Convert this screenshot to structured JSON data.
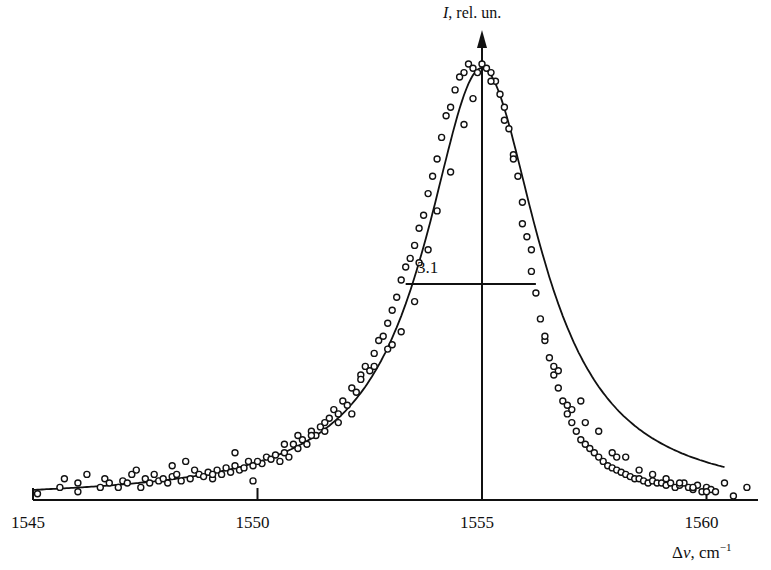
{
  "chart_data": {
    "type": "scatter",
    "title": "",
    "xlabel": "Δν, cm⁻¹",
    "xlabel_symbol": "Δν",
    "xlabel_unit": "cm",
    "xlabel_unit_exp": "−1",
    "ylabel": "I, rel. un.",
    "ylabel_symbol": "I",
    "ylabel_rest": ", rel. un.",
    "xlim": [
      1545,
      1561.2
    ],
    "ylim": [
      0,
      1.08
    ],
    "x_ticks": [
      1545,
      1550,
      1555,
      1560
    ],
    "x_tick_labels": [
      "1545",
      "1550",
      "1555",
      "1560"
    ],
    "grid": false,
    "legend": null,
    "annotations": [
      {
        "type": "fwhm_line",
        "label": "3.1",
        "x_from": 1553.3,
        "x_to": 1556.2,
        "y": 0.5
      }
    ],
    "series": [
      {
        "name": "fit",
        "kind": "line",
        "model": "lorentzian",
        "center": 1555.0,
        "fwhm": 3.1,
        "amplitude": 1.0
      },
      {
        "name": "measured",
        "kind": "scatter",
        "marker": "open-circle",
        "x": [
          1545.1,
          1545.6,
          1545.7,
          1546.0,
          1546.0,
          1546.2,
          1546.5,
          1546.6,
          1546.7,
          1546.9,
          1547.0,
          1547.1,
          1547.2,
          1547.4,
          1547.5,
          1547.6,
          1547.7,
          1547.8,
          1547.9,
          1548.0,
          1548.1,
          1548.2,
          1548.3,
          1548.5,
          1548.6,
          1548.7,
          1548.8,
          1548.9,
          1549.0,
          1549.1,
          1549.2,
          1549.3,
          1549.4,
          1549.5,
          1549.6,
          1549.7,
          1549.8,
          1549.9,
          1549.9,
          1550.1,
          1550.2,
          1550.3,
          1550.4,
          1550.5,
          1550.6,
          1550.7,
          1550.8,
          1550.9,
          1551.0,
          1551.1,
          1551.2,
          1551.3,
          1551.4,
          1551.5,
          1551.6,
          1551.7,
          1551.8,
          1551.9,
          1552.0,
          1552.1,
          1552.2,
          1552.3,
          1552.4,
          1552.5,
          1552.6,
          1552.7,
          1552.8,
          1552.9,
          1553.0,
          1553.1,
          1553.2,
          1553.3,
          1553.4,
          1553.5,
          1553.6,
          1553.7,
          1553.8,
          1553.9,
          1554.0,
          1554.1,
          1554.2,
          1554.3,
          1554.4,
          1554.5,
          1554.6,
          1554.7,
          1554.8,
          1554.9,
          1555.0,
          1555.1,
          1555.2,
          1555.3,
          1555.4,
          1555.5,
          1555.6,
          1555.7,
          1555.8,
          1555.9,
          1556.0,
          1556.1,
          1556.2,
          1556.3,
          1556.4,
          1556.5,
          1556.6,
          1556.7,
          1556.8,
          1556.9,
          1557.0,
          1557.1,
          1557.2,
          1557.3,
          1557.4,
          1557.5,
          1557.6,
          1557.7,
          1557.8,
          1557.9,
          1558.0,
          1558.1,
          1558.2,
          1558.3,
          1558.4,
          1558.5,
          1558.6,
          1558.7,
          1558.8,
          1558.9,
          1559.0,
          1559.1,
          1559.2,
          1559.3,
          1559.4,
          1559.5,
          1559.6,
          1559.7,
          1559.8,
          1559.9,
          1560.0,
          1560.1,
          1560.2,
          1560.4,
          1560.6,
          1560.9,
          1547.3,
          1548.1,
          1548.4,
          1549.0,
          1549.5,
          1550.0,
          1550.6,
          1551.2,
          1551.8,
          1552.3,
          1552.6,
          1552.9,
          1553.2,
          1553.5,
          1553.8,
          1554.0,
          1554.3,
          1554.6,
          1554.8,
          1555.2,
          1555.5,
          1555.7,
          1555.9,
          1556.1,
          1556.4,
          1556.7,
          1557.0,
          1557.3,
          1557.6,
          1557.9,
          1558.2,
          1558.5,
          1558.8,
          1559.1,
          1559.4,
          1559.7,
          1560.0,
          1552.1,
          1551.5,
          1550.9,
          1553.0,
          1556.6,
          1557.2,
          1558.0,
          1553.6,
          1556.9
        ],
        "y": [
          0.005,
          0.02,
          0.04,
          0.03,
          0.01,
          0.05,
          0.02,
          0.04,
          0.03,
          0.02,
          0.035,
          0.03,
          0.05,
          0.02,
          0.04,
          0.03,
          0.05,
          0.035,
          0.04,
          0.03,
          0.045,
          0.05,
          0.035,
          0.04,
          0.06,
          0.05,
          0.045,
          0.055,
          0.04,
          0.06,
          0.05,
          0.065,
          0.055,
          0.07,
          0.06,
          0.065,
          0.08,
          0.07,
          0.035,
          0.075,
          0.09,
          0.085,
          0.095,
          0.08,
          0.1,
          0.09,
          0.12,
          0.11,
          0.13,
          0.12,
          0.15,
          0.14,
          0.16,
          0.15,
          0.18,
          0.2,
          0.17,
          0.22,
          0.21,
          0.25,
          0.24,
          0.28,
          0.3,
          0.29,
          0.33,
          0.36,
          0.37,
          0.4,
          0.43,
          0.46,
          0.5,
          0.53,
          0.55,
          0.58,
          0.62,
          0.65,
          0.7,
          0.74,
          0.78,
          0.83,
          0.88,
          0.9,
          0.94,
          0.97,
          0.98,
          1.0,
          0.99,
          0.98,
          1.0,
          0.99,
          0.98,
          0.96,
          0.93,
          0.9,
          0.85,
          0.79,
          0.74,
          0.68,
          0.6,
          0.52,
          0.47,
          0.41,
          0.36,
          0.32,
          0.28,
          0.25,
          0.22,
          0.19,
          0.17,
          0.15,
          0.13,
          0.12,
          0.11,
          0.1,
          0.09,
          0.08,
          0.07,
          0.065,
          0.06,
          0.055,
          0.05,
          0.045,
          0.04,
          0.04,
          0.035,
          0.03,
          0.035,
          0.03,
          0.03,
          0.025,
          0.03,
          0.02,
          0.025,
          0.03,
          0.02,
          0.015,
          0.025,
          0.01,
          0.02,
          0.015,
          0.01,
          0.03,
          0.0,
          0.02,
          0.06,
          0.07,
          0.08,
          0.05,
          0.1,
          0.08,
          0.12,
          0.14,
          0.19,
          0.27,
          0.3,
          0.34,
          0.38,
          0.45,
          0.57,
          0.66,
          0.75,
          0.86,
          0.92,
          0.96,
          0.87,
          0.78,
          0.63,
          0.57,
          0.37,
          0.29,
          0.2,
          0.17,
          0.15,
          0.1,
          0.09,
          0.06,
          0.05,
          0.04,
          0.03,
          0.02,
          0.01,
          0.19,
          0.17,
          0.14,
          0.35,
          0.3,
          0.22,
          0.09,
          0.54,
          0.21
        ]
      }
    ],
    "layout": {
      "px_origin_x": 33,
      "px_per_unit_x": 44.9,
      "px_baseline_y": 500,
      "px_per_unit_y": 432,
      "axis_end_x": 758,
      "y_axis_x_value": 1555,
      "y_axis_top_px": 30
    }
  }
}
